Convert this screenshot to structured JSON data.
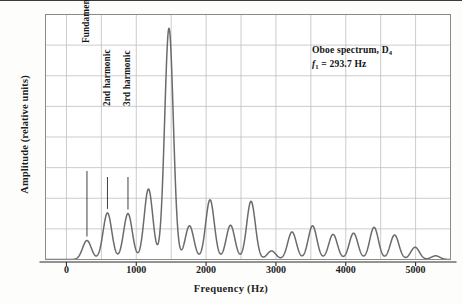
{
  "figure": {
    "background": "#fdfdfc",
    "line_color": "#6b6b6b",
    "grid_color": "#bfbfbf",
    "frame_color": "#8a8a8a"
  },
  "annotation": {
    "line1_pre": "Oboe spectrum, D",
    "line1_sub": "4",
    "line2_f": "f",
    "line2_sub": "1",
    "line2_rest": " =  293.7 Hz"
  },
  "callouts": [
    {
      "label": "Fundamental or 1st harmonic",
      "freq": 293.7
    },
    {
      "label": "2nd harmonic",
      "freq": 587.4
    },
    {
      "label": "3rd harmonic",
      "freq": 881.1
    }
  ],
  "chart_data": {
    "type": "line",
    "title": "Oboe spectrum, D4",
    "xlabel": "Frequency  (Hz)",
    "ylabel": "Amplitude (relative units)",
    "xlim": [
      -300,
      5500
    ],
    "ylim": [
      0,
      8
    ],
    "xticks": [
      0,
      1000,
      2000,
      3000,
      4000,
      5000
    ],
    "xticklabels": [
      "0",
      "1000",
      "2000",
      "3000",
      "4000",
      "5000"
    ],
    "yticks": [
      0,
      1,
      2,
      3,
      4,
      5,
      6,
      7,
      8
    ],
    "yticklabels": [
      "",
      "",
      "",
      "",
      "",
      "",
      "",
      "",
      ""
    ],
    "grid": true,
    "legend": "none",
    "fundamental_hz": 293.7,
    "peak_width_hz": 62,
    "harmonics": [
      {
        "n": 1,
        "freq": 293.7,
        "amplitude": 0.62
      },
      {
        "n": 2,
        "freq": 587.4,
        "amplitude": 1.52
      },
      {
        "n": 3,
        "freq": 881.1,
        "amplitude": 1.5
      },
      {
        "n": 4,
        "freq": 1174.8,
        "amplitude": 2.3
      },
      {
        "n": 5,
        "freq": 1468.5,
        "amplitude": 7.55
      },
      {
        "n": 6,
        "freq": 1762.2,
        "amplitude": 1.1
      },
      {
        "n": 7,
        "freq": 2055.9,
        "amplitude": 1.95
      },
      {
        "n": 8,
        "freq": 2349.6,
        "amplitude": 1.12
      },
      {
        "n": 9,
        "freq": 2643.3,
        "amplitude": 1.9
      },
      {
        "n": 10,
        "freq": 2937.0,
        "amplitude": 0.28
      },
      {
        "n": 11,
        "freq": 3230.7,
        "amplitude": 0.9
      },
      {
        "n": 12,
        "freq": 3524.4,
        "amplitude": 1.1
      },
      {
        "n": 13,
        "freq": 3818.1,
        "amplitude": 0.82
      },
      {
        "n": 14,
        "freq": 4111.8,
        "amplitude": 0.86
      },
      {
        "n": 15,
        "freq": 4405.5,
        "amplitude": 1.05
      },
      {
        "n": 16,
        "freq": 4699.2,
        "amplitude": 0.8
      },
      {
        "n": 17,
        "freq": 4992.9,
        "amplitude": 0.4
      },
      {
        "n": 18,
        "freq": 5286.6,
        "amplitude": 0.12
      }
    ]
  }
}
